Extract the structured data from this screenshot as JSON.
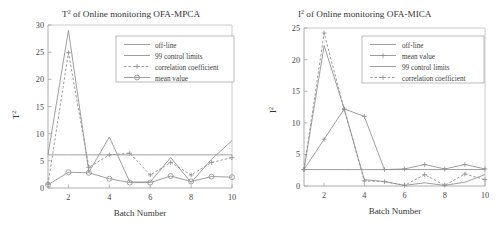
{
  "figure": {
    "panels": [
      "left",
      "right"
    ]
  },
  "left": {
    "title_main": "of Online monitoring OFA-MPCA",
    "title_var": "T",
    "title_sup": "2",
    "ylabel_var": "T",
    "ylabel_sup": "2",
    "xlabel": "Batch Number",
    "yticks": [
      "0",
      "5",
      "10",
      "15",
      "20",
      "25",
      "30"
    ],
    "xticks": [
      "2",
      "4",
      "6",
      "8",
      "10"
    ],
    "legend": [
      {
        "label": "off-line",
        "style": "solid",
        "marker": "none"
      },
      {
        "label": "99 control limits",
        "style": "solid",
        "marker": "none"
      },
      {
        "label": "correlation coefficient",
        "style": "dashed",
        "marker": "plus"
      },
      {
        "label": "mean value",
        "style": "solid",
        "marker": "circle"
      }
    ]
  },
  "right": {
    "title_main": "of Online monitoring OFA-MICA",
    "title_var": "I",
    "title_sup": "2",
    "ylabel_var": "I",
    "ylabel_sup": "2",
    "xlabel": "Batch Number",
    "yticks": [
      "0",
      "5",
      "10",
      "15",
      "20",
      "25"
    ],
    "xticks": [
      "2",
      "4",
      "6",
      "8",
      "10"
    ],
    "legend": [
      {
        "label": "off-line",
        "style": "solid",
        "marker": "none"
      },
      {
        "label": "mean value",
        "style": "solid",
        "marker": "plus"
      },
      {
        "label": "99 control limits",
        "style": "solid",
        "marker": "none"
      },
      {
        "label": "correlation coefficient",
        "style": "dashed",
        "marker": "plus"
      }
    ]
  },
  "chart_data": [
    {
      "type": "line",
      "id": "left",
      "title": "T² of Online monitoring OFA-MPCA",
      "xlabel": "Batch Number",
      "ylabel": "T²",
      "xlim": [
        1,
        10
      ],
      "ylim": [
        0,
        30
      ],
      "xticks": [
        2,
        4,
        6,
        8,
        10
      ],
      "yticks": [
        0,
        5,
        10,
        15,
        20,
        25,
        30
      ],
      "grid": false,
      "legend_position": "upper-center",
      "x": [
        1,
        2,
        3,
        4,
        5,
        6,
        7,
        8,
        9,
        10
      ],
      "series": [
        {
          "name": "off-line",
          "style": "solid",
          "marker": "none",
          "values": [
            6.1,
            29.0,
            2.9,
            9.4,
            1.1,
            1.1,
            5.6,
            1.0,
            5.3,
            8.7
          ]
        },
        {
          "name": "99 control limits",
          "style": "solid",
          "marker": "none",
          "constant": 6.1,
          "values": [
            6.1,
            6.1,
            6.1,
            6.1,
            6.1,
            6.1,
            6.1,
            6.1,
            6.1,
            6.1
          ]
        },
        {
          "name": "correlation coefficient",
          "style": "dashed",
          "marker": "plus",
          "values": [
            0.7,
            24.9,
            3.8,
            6.1,
            6.4,
            2.4,
            4.7,
            2.4,
            4.7,
            5.6
          ]
        },
        {
          "name": "mean value",
          "style": "solid",
          "marker": "circle",
          "values": [
            0.6,
            2.9,
            2.8,
            1.7,
            1.0,
            1.0,
            2.2,
            1.2,
            2.1,
            2.0
          ]
        }
      ]
    },
    {
      "type": "line",
      "id": "right",
      "title": "I² of Online monitoring OFA-MICA",
      "xlabel": "Batch Number",
      "ylabel": "I²",
      "xlim": [
        1,
        10
      ],
      "ylim": [
        0,
        25
      ],
      "xticks": [
        2,
        4,
        6,
        8,
        10
      ],
      "yticks": [
        0,
        5,
        10,
        15,
        20,
        25
      ],
      "grid": false,
      "legend_position": "upper-right",
      "x": [
        1,
        2,
        3,
        4,
        5,
        6,
        7,
        8,
        9,
        10
      ],
      "series": [
        {
          "name": "off-line",
          "style": "solid",
          "marker": "none",
          "values": [
            2.6,
            22.2,
            12.2,
            1.0,
            0.7,
            0.1,
            0.5,
            0.1,
            0.6,
            1.8
          ]
        },
        {
          "name": "mean value",
          "style": "solid",
          "marker": "plus",
          "values": [
            2.6,
            7.4,
            12.2,
            11.0,
            2.6,
            2.7,
            3.4,
            2.7,
            3.4,
            2.7
          ]
        },
        {
          "name": "99 control limits",
          "style": "solid",
          "marker": "none",
          "constant": 2.6,
          "values": [
            2.6,
            2.6,
            2.6,
            2.6,
            2.6,
            2.6,
            2.6,
            2.6,
            2.6,
            2.6
          ]
        },
        {
          "name": "correlation coefficient",
          "style": "dashed",
          "marker": "plus",
          "values": [
            2.6,
            24.2,
            12.1,
            0.8,
            0.7,
            0.1,
            1.8,
            0.1,
            1.9,
            1.0
          ]
        }
      ]
    }
  ]
}
